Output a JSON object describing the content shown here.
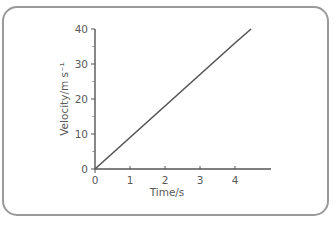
{
  "chart_data": {
    "type": "line",
    "title": "",
    "xlabel": "Time/s",
    "ylabel": "Velocity/m s⁻¹",
    "x_ticks": [
      "0",
      "1",
      "2",
      "3",
      "4"
    ],
    "y_ticks": [
      "0",
      "10",
      "20",
      "30",
      "40"
    ],
    "xlim": [
      0,
      5
    ],
    "ylim": [
      0,
      40
    ],
    "grid": false,
    "legend": null,
    "series": [
      {
        "name": "velocity",
        "x": [
          0,
          1,
          2,
          3,
          4,
          4.46
        ],
        "y": [
          0,
          9,
          18,
          27,
          36,
          40
        ]
      }
    ]
  },
  "colors": {
    "line": "#555555",
    "axis": "#555555",
    "border": "#9a9a9a",
    "text": "#5a5a5a"
  }
}
